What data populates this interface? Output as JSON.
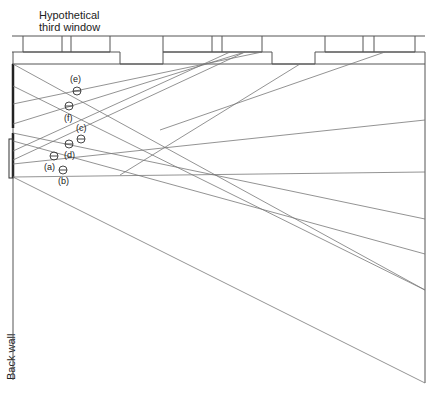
{
  "labels": {
    "top_line1": "Hypothetical",
    "top_line2": "third window",
    "wall": "Back wall"
  },
  "points": [
    {
      "id": "e",
      "label": "(e)",
      "x": 77,
      "y": 91,
      "lx": 70,
      "ly": 82
    },
    {
      "id": "f",
      "label": "(f)",
      "x": 69,
      "y": 106,
      "lx": 64,
      "ly": 121
    },
    {
      "id": "c",
      "label": "(c)",
      "x": 81,
      "y": 139,
      "lx": 76,
      "ly": 131
    },
    {
      "id": "d",
      "label": "(d)",
      "x": 69,
      "y": 144,
      "lx": 64,
      "ly": 158
    },
    {
      "id": "a",
      "label": "(a)",
      "x": 54,
      "y": 156,
      "lx": 44,
      "ly": 170
    },
    {
      "id": "b",
      "label": "(b)",
      "x": 63,
      "y": 170,
      "lx": 58,
      "ly": 184
    }
  ],
  "colors": {
    "line": "#555555",
    "ray": "#777777",
    "wall_bar": "#222222"
  }
}
